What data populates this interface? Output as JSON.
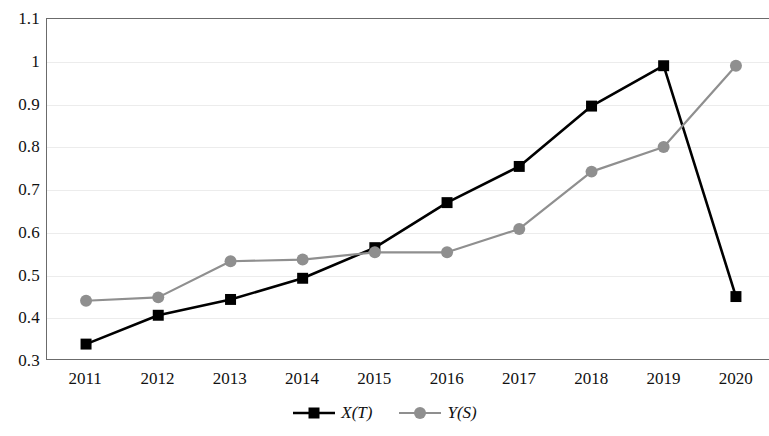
{
  "chart_data": {
    "type": "line",
    "title": "",
    "subtitle": "",
    "xlabel": "",
    "ylabel": "",
    "categories": [
      "2011",
      "2012",
      "2013",
      "2014",
      "2015",
      "2016",
      "2017",
      "2018",
      "2019",
      "2020"
    ],
    "series": [
      {
        "name": "X(T)",
        "color": "#000000",
        "marker": "square",
        "values": [
          0.335,
          0.403,
          0.44,
          0.49,
          0.562,
          0.668,
          0.753,
          0.895,
          0.99,
          0.447
        ]
      },
      {
        "name": "Y(S)",
        "color": "#8f8f8f",
        "marker": "circle",
        "values": [
          0.437,
          0.445,
          0.53,
          0.534,
          0.551,
          0.551,
          0.606,
          0.741,
          0.799,
          0.99
        ]
      }
    ],
    "ylim": [
      0.3,
      1.1
    ],
    "ytick_step": 0.1,
    "ytick_labels": [
      "1.1",
      "1",
      "0.9",
      "0.8",
      "0.7",
      "0.6",
      "0.5",
      "0.4",
      "0.3"
    ],
    "grid": true,
    "grid_axis": "y",
    "legend_position": "bottom",
    "colors": {
      "series_x": "#000000",
      "series_y": "#8f8f8f",
      "gridline": "#ececec",
      "axis": "#6b6b6b",
      "background": "#ffffff",
      "text": "#111111"
    }
  }
}
